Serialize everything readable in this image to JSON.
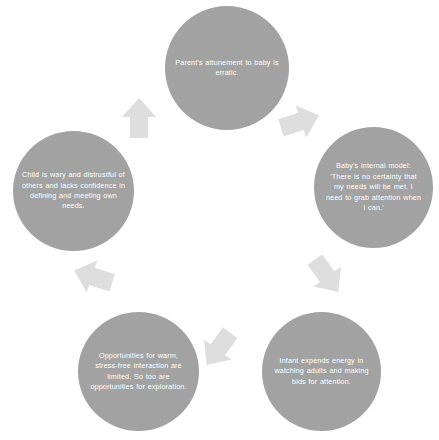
{
  "diagram": {
    "type": "cycle",
    "title": "",
    "direction": "clockwise",
    "node_count": 5,
    "colors": {
      "background": "#ffffff",
      "node_fill": "#a2a2a2",
      "node_text": "#ffffff",
      "arrow_fill": "#dedede"
    },
    "nodes": [
      {
        "id": "node-0",
        "position": "top",
        "label": "Parent's attunement to baby is erratic."
      },
      {
        "id": "node-1",
        "position": "right",
        "label": "Baby's internal model: 'There is no certainty that my needs will be met. I need to grab attention when I can.'"
      },
      {
        "id": "node-2",
        "position": "bottom-right",
        "label": "Infant expends energy in watching adults and making bids for attention."
      },
      {
        "id": "node-3",
        "position": "bottom-left",
        "label": "Opportunities for warm, stress-free interaction are limited. So too are opportunities for exploration."
      },
      {
        "id": "node-4",
        "position": "left",
        "label": "Child is wary and distrustful of others and lacks confidence in defining and meeting own needs."
      }
    ],
    "arrows": [
      {
        "id": "arrow-0",
        "icon": "block-arrow-icon",
        "from": "node-0",
        "to": "node-1",
        "direction": "down-right"
      },
      {
        "id": "arrow-1",
        "icon": "block-arrow-icon",
        "from": "node-1",
        "to": "node-2",
        "direction": "down-left"
      },
      {
        "id": "arrow-2",
        "icon": "block-arrow-icon",
        "from": "node-2",
        "to": "node-3",
        "direction": "left"
      },
      {
        "id": "arrow-3",
        "icon": "block-arrow-icon",
        "from": "node-3",
        "to": "node-4",
        "direction": "up-left"
      },
      {
        "id": "arrow-4",
        "icon": "block-arrow-icon",
        "from": "node-4",
        "to": "node-0",
        "direction": "up-right"
      }
    ]
  }
}
